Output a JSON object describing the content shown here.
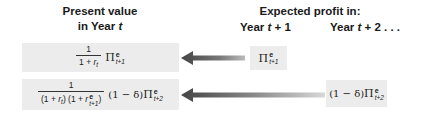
{
  "headings": {
    "left_line1": "Present value",
    "left_line2_prefix": "in Year ",
    "left_line2_var": "t",
    "right_title": "Expected profit in:",
    "col1_prefix": "Year ",
    "col1_var": "t",
    "col1_suffix": " + 1",
    "col2_prefix": "Year ",
    "col2_var": "t",
    "col2_suffix": " + 2 . . ."
  },
  "rows": [
    {
      "pv": {
        "numerator": "1",
        "denominator_pre": "1 + ",
        "denominator_var": "r",
        "denominator_sub": "t",
        "factor": "",
        "pi": "Π",
        "sup": "e",
        "sub": "t+1"
      },
      "profit": {
        "factor": "",
        "pi": "Π",
        "sup": "e",
        "sub": "t+1"
      }
    },
    {
      "pv": {
        "numerator": "1",
        "den_part1": "(1 + ",
        "den_var1": "r",
        "den_sub1": "t",
        "den_part2": ") (1 + ",
        "den_var2": "r",
        "den_sup2": "e",
        "den_sub2": "t+1",
        "den_part3": ")",
        "factor": "(1 − δ)",
        "pi": "Π",
        "sup": "e",
        "sub": "t+2"
      },
      "profit": {
        "factor": "(1 − δ)",
        "pi": "Π",
        "sup": "e",
        "sub": "t+2"
      }
    }
  ],
  "colors": {
    "box_fill": "#ececec",
    "arrow_dark": "#4a4a4a",
    "arrow_light": "#d8d8d8"
  }
}
